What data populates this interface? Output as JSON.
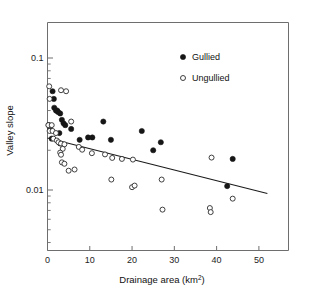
{
  "figure": {
    "background": "#ffffff",
    "frame_color": "#6e6e6e",
    "marker_color": "#161616",
    "line_color": "#1a1a1a"
  },
  "axes": {
    "x_title_main": "Drainage area (km",
    "x_title_sup": "2",
    "x_title_close": ")",
    "y_title": "Valley slope",
    "x_ticks": [
      "0",
      "10",
      "20",
      "30",
      "40",
      "50"
    ],
    "y_ticks": [
      "0.1",
      "0.01"
    ]
  },
  "legend": {
    "items": [
      {
        "label": "Gullied",
        "marker": "filled-circle"
      },
      {
        "label": "Ungullied",
        "marker": "open-circle"
      }
    ]
  },
  "chart_data": {
    "type": "scatter",
    "title": "",
    "xlabel": "Drainage area (km2)",
    "ylabel": "Valley slope",
    "xlim": [
      0,
      57
    ],
    "ylim": [
      0.005,
      0.15
    ],
    "yscale": "log",
    "xscale": "linear",
    "grid": false,
    "legend_position": "top-right",
    "series": [
      {
        "name": "Gullied",
        "marker": "filled-circle",
        "points": [
          [
            1.2,
            0.056
          ],
          [
            1.5,
            0.049
          ],
          [
            1.6,
            0.042
          ],
          [
            2.0,
            0.04
          ],
          [
            2.3,
            0.04
          ],
          [
            2.5,
            0.039
          ],
          [
            3.0,
            0.038
          ],
          [
            3.4,
            0.034
          ],
          [
            0.3,
            0.031
          ],
          [
            0.6,
            0.03
          ],
          [
            3.8,
            0.032
          ],
          [
            4.2,
            0.031
          ],
          [
            2.8,
            0.027
          ],
          [
            5.6,
            0.029
          ],
          [
            7.6,
            0.024
          ],
          [
            9.6,
            0.025
          ],
          [
            10.6,
            0.025
          ],
          [
            13.2,
            0.033
          ],
          [
            15.0,
            0.024
          ],
          [
            22.3,
            0.028
          ],
          [
            25.0,
            0.02
          ],
          [
            26.8,
            0.023
          ],
          [
            42.5,
            0.0107
          ],
          [
            43.8,
            0.0172
          ],
          [
            1.0,
            0.0245
          ],
          [
            3.0,
            0.0225
          ]
        ]
      },
      {
        "name": "Ungullied",
        "marker": "open-circle",
        "points": [
          [
            0.4,
            0.061
          ],
          [
            0.5,
            0.049
          ],
          [
            3.2,
            0.057
          ],
          [
            4.4,
            0.056
          ],
          [
            0.2,
            0.031
          ],
          [
            1.0,
            0.031
          ],
          [
            5.6,
            0.033
          ],
          [
            0.5,
            0.028
          ],
          [
            1.2,
            0.028
          ],
          [
            2.0,
            0.027
          ],
          [
            1.4,
            0.0245
          ],
          [
            2.2,
            0.0237
          ],
          [
            2.6,
            0.023
          ],
          [
            3.2,
            0.0225
          ],
          [
            4.0,
            0.0222
          ],
          [
            3.6,
            0.0205
          ],
          [
            3.0,
            0.0192
          ],
          [
            3.2,
            0.0185
          ],
          [
            7.4,
            0.0212
          ],
          [
            8.2,
            0.0202
          ],
          [
            10.5,
            0.019
          ],
          [
            13.6,
            0.0186
          ],
          [
            15.3,
            0.0175
          ],
          [
            17.6,
            0.0172
          ],
          [
            20.2,
            0.017
          ],
          [
            5.0,
            0.014
          ],
          [
            6.4,
            0.0143
          ],
          [
            15.1,
            0.012
          ],
          [
            20.0,
            0.0105
          ],
          [
            20.6,
            0.0108
          ],
          [
            27.0,
            0.012
          ],
          [
            27.2,
            0.0071
          ],
          [
            38.4,
            0.0073
          ],
          [
            38.6,
            0.0068
          ],
          [
            38.8,
            0.0176
          ],
          [
            43.8,
            0.0086
          ],
          [
            3.4,
            0.0162
          ],
          [
            4.0,
            0.0158
          ]
        ]
      }
    ],
    "fit_line": {
      "name": "regression",
      "x_start": 0.0,
      "y_start": 0.0248,
      "x_end": 52.0,
      "y_end": 0.0094
    }
  }
}
